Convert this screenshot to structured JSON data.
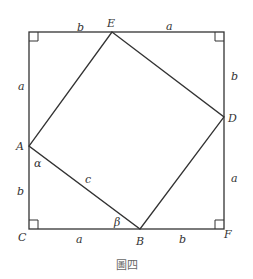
{
  "figure": {
    "caption": "圖四",
    "vertices": {
      "A": "A",
      "B": "B",
      "C": "C",
      "D": "D",
      "E": "E",
      "F": "F"
    },
    "segment_labels": {
      "top_left": "b",
      "top_right": "a",
      "left_upper": "a",
      "left_lower": "b",
      "right_upper": "b",
      "right_lower": "a",
      "bottom_left": "a",
      "bottom_right": "b",
      "hypotenuse": "c"
    },
    "angles": {
      "at_A": "α",
      "at_B": "β"
    },
    "colors": {
      "line": "#333333",
      "text": "#333333",
      "caption": "#666666"
    }
  }
}
